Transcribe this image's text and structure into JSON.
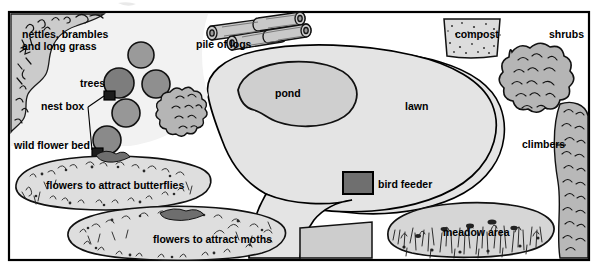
{
  "figure": {
    "kind": "wildlife-garden-plan",
    "background_color": "#ffffff",
    "frame_color": "#000000",
    "ink_color": "#000000"
  },
  "palette": {
    "paper": "#ffffff",
    "lawn_fill": "#e4e4e4",
    "pond_fill": "#cfcfcf",
    "tree_fill": "#8f8f8f",
    "shrub_fill": "#b5b5b5",
    "bed_fill": "#dedede",
    "meadow_fill": "#d6d6d6",
    "compost_fill": "#dcdcdc",
    "feeder_fill": "#7a7a7a",
    "log_fill": "#c9c9c9",
    "nettle_fill": "#cbcbcb"
  },
  "labels": [
    {
      "id": "nettles",
      "text": "nettles, brambles",
      "x": 22,
      "y": 38,
      "size": 10.5,
      "anchor": "start"
    },
    {
      "id": "nettles2",
      "text": "and long grass",
      "x": 22,
      "y": 50,
      "size": 10.5,
      "anchor": "start"
    },
    {
      "id": "pile-of-logs",
      "text": "pile of logs",
      "x": 196,
      "y": 48,
      "size": 10.5,
      "anchor": "start"
    },
    {
      "id": "compost",
      "text": "compost",
      "x": 455,
      "y": 38,
      "size": 10.5,
      "anchor": "start"
    },
    {
      "id": "shrubs",
      "text": "shrubs",
      "x": 549,
      "y": 38,
      "size": 10.5,
      "anchor": "start"
    },
    {
      "id": "trees",
      "text": "trees",
      "x": 80,
      "y": 87,
      "size": 10.5,
      "anchor": "start"
    },
    {
      "id": "nest-box",
      "text": "nest box",
      "x": 41,
      "y": 110,
      "size": 10.5,
      "anchor": "start"
    },
    {
      "id": "pond",
      "text": "pond",
      "x": 275,
      "y": 97,
      "size": 10.5,
      "anchor": "start"
    },
    {
      "id": "lawn",
      "text": "lawn",
      "x": 405,
      "y": 110,
      "size": 10.5,
      "anchor": "start"
    },
    {
      "id": "climbers",
      "text": "climbers",
      "x": 522,
      "y": 148,
      "size": 10.5,
      "anchor": "start"
    },
    {
      "id": "wild-flower-bed",
      "text": "wild flower bed",
      "x": 14,
      "y": 149,
      "size": 10.5,
      "anchor": "start"
    },
    {
      "id": "butterflies",
      "text": "flowers to attract butterflies",
      "x": 46,
      "y": 189,
      "size": 10.5,
      "anchor": "start"
    },
    {
      "id": "bird-feeder",
      "text": "bird feeder",
      "x": 378,
      "y": 184,
      "size": 10.5,
      "anchor": "start"
    },
    {
      "id": "meadow-area",
      "text": "meadow area",
      "x": 443,
      "y": 232,
      "size": 10.5,
      "anchor": "start"
    },
    {
      "id": "moths",
      "text": "flowers to attract moths",
      "x": 153,
      "y": 243,
      "size": 10.5,
      "anchor": "start"
    }
  ],
  "regions": [
    {
      "id": "nettle-patch",
      "name": "nettles-brambles-long-grass-area"
    },
    {
      "id": "log-pile",
      "name": "pile-of-logs"
    },
    {
      "id": "compost-bin",
      "name": "compost-bin"
    },
    {
      "id": "shrub-group",
      "name": "shrubs"
    },
    {
      "id": "tree-group",
      "name": "trees"
    },
    {
      "id": "nest-box-a",
      "name": "nest-box"
    },
    {
      "id": "nest-box-b",
      "name": "nest-box"
    },
    {
      "id": "pond-shape",
      "name": "pond"
    },
    {
      "id": "lawn-shape",
      "name": "lawn"
    },
    {
      "id": "climber-strip",
      "name": "climbers"
    },
    {
      "id": "butterfly-bed",
      "name": "wild-flower-bed-butterflies"
    },
    {
      "id": "moth-bed",
      "name": "wild-flower-bed-moths"
    },
    {
      "id": "feeder-box",
      "name": "bird-feeder"
    },
    {
      "id": "meadow-shape",
      "name": "meadow-area"
    },
    {
      "id": "patio-shape",
      "name": "paved-patio"
    }
  ]
}
